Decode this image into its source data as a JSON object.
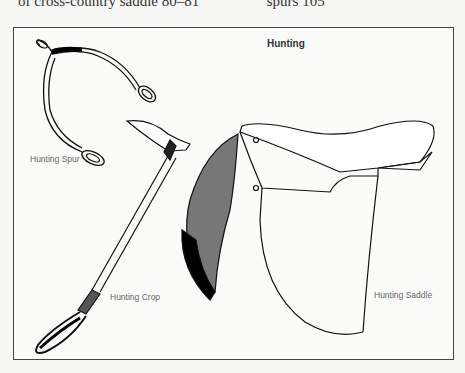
{
  "header_fragment": {
    "left": "of cross-country saddle  80–81",
    "right": "spurs  105"
  },
  "figure": {
    "title": "Hunting",
    "labels": {
      "spur": "Hunting Spur",
      "crop": "Hunting Crop",
      "saddle": "Hunting Saddle"
    }
  }
}
